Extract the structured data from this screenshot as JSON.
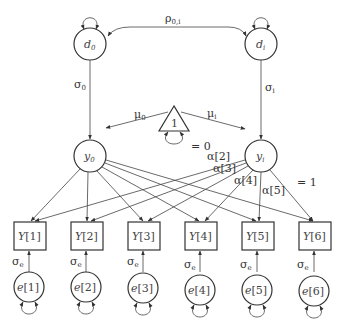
{
  "diagram": {
    "type": "latent growth curve path diagram",
    "latents_top": [
      {
        "id": "d0",
        "label": "d",
        "sub": "0"
      },
      {
        "id": "di",
        "label": "d",
        "sub": "i"
      }
    ],
    "latents_mid": [
      {
        "id": "y0",
        "label": "y",
        "sub": "0"
      },
      {
        "id": "yi",
        "label": "y",
        "sub": "i"
      }
    ],
    "constant": {
      "label": "1"
    },
    "labels": {
      "rho": "ρ",
      "rho_sub": "0,i",
      "sigma0": "σ",
      "sigma0_sub": "0",
      "sigmai": "σ",
      "sigmai_sub": "i",
      "mu0": "μ",
      "mu0_sub": "0",
      "mui": "μ",
      "mui_sub": "i",
      "eq0": "= 0",
      "a2": "α[2]",
      "a3": "α[3]",
      "a4": "α[4]",
      "a5": "α[5]",
      "eq1": "= 1",
      "sigma_e": "σ",
      "sigma_e_sub": "e"
    },
    "observed": [
      {
        "label": "Y",
        "idx": "[1]"
      },
      {
        "label": "Y",
        "idx": "[2]"
      },
      {
        "label": "Y",
        "idx": "[3]"
      },
      {
        "label": "Y",
        "idx": "[4]"
      },
      {
        "label": "Y",
        "idx": "[5]"
      },
      {
        "label": "Y",
        "idx": "[6]"
      }
    ],
    "errors": [
      {
        "label": "e",
        "idx": "[1]"
      },
      {
        "label": "e",
        "idx": "[2]"
      },
      {
        "label": "e",
        "idx": "[3]"
      },
      {
        "label": "e",
        "idx": "[4]"
      },
      {
        "label": "e",
        "idx": "[5]"
      },
      {
        "label": "e",
        "idx": "[6]"
      }
    ]
  }
}
